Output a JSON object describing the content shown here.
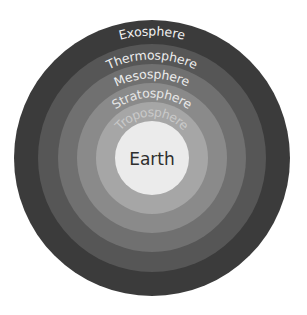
{
  "diagram": {
    "center": {
      "x": 152,
      "y": 158
    },
    "layers": [
      {
        "name": "Exosphere",
        "radius": 138,
        "fill": "#3b3b3b",
        "text_color": "#f2f2f2",
        "label_radius": 127
      },
      {
        "name": "Thermosphere",
        "radius": 114,
        "fill": "#565656",
        "text_color": "#eeeeee",
        "label_radius": 103
      },
      {
        "name": "Mesosphere",
        "radius": 94,
        "fill": "#707070",
        "text_color": "#ececec",
        "label_radius": 84
      },
      {
        "name": "Stratosphere",
        "radius": 75,
        "fill": "#8a8a8a",
        "text_color": "#e6e6e6",
        "label_radius": 65
      },
      {
        "name": "Troposphere",
        "radius": 56,
        "fill": "#a6a6a6",
        "text_color": "#c9c9c9",
        "label_radius": 46
      }
    ],
    "core": {
      "name": "Earth",
      "radius": 37,
      "fill": "#ebebeb",
      "text_color": "#2e2e2e"
    }
  }
}
